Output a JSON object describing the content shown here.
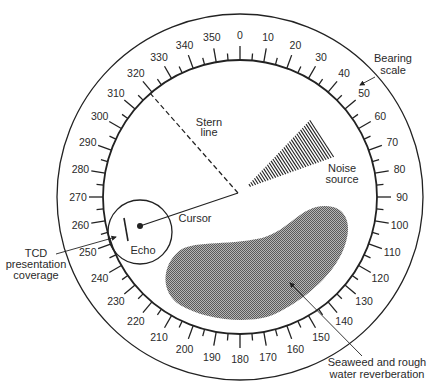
{
  "diagram": {
    "type": "sonar bearing display",
    "center": {
      "x": 240,
      "y": 197
    },
    "outer_radius": 183,
    "inner_radius": 137,
    "colors": {
      "ink": "#222222",
      "reverberation_fill": "#8a8a8a",
      "background": "#ffffff"
    }
  },
  "bearing_scale": {
    "major_step_deg": 10,
    "minor_step_deg": 5,
    "labels": [
      "0",
      "10",
      "20",
      "30",
      "40",
      "50",
      "60",
      "70",
      "80",
      "90",
      "100",
      "110",
      "120",
      "130",
      "140",
      "150",
      "160",
      "170",
      "180",
      "190",
      "200",
      "210",
      "220",
      "230",
      "240",
      "250",
      "260",
      "270",
      "280",
      "290",
      "300",
      "310",
      "320",
      "330",
      "340",
      "350"
    ]
  },
  "labels": {
    "bearing_scale": [
      "Bearing",
      "scale"
    ],
    "stern_line": [
      "Stern",
      "line"
    ],
    "noise_source": [
      "Noise",
      "source"
    ],
    "cursor": "Cursor",
    "echo": "Echo",
    "tcd": [
      "TCD",
      "presentation",
      "coverage"
    ],
    "reverberation": [
      "Seaweed and rough",
      "water  reverberation"
    ]
  }
}
